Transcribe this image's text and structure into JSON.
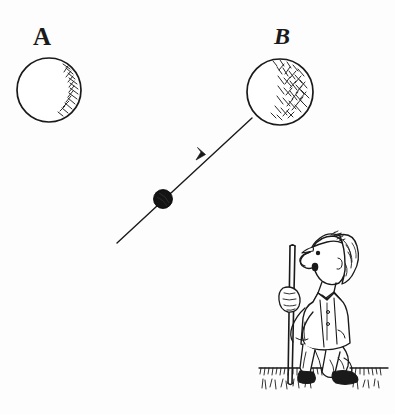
{
  "figure": {
    "background_color": "#fdfdfd",
    "ink_color": "#1a1a1a",
    "width": 395,
    "height": 414,
    "labels": [
      {
        "id": "A",
        "text": "A",
        "x": 33,
        "y": 24
      },
      {
        "id": "B",
        "text": "B",
        "x": 274,
        "y": 24
      }
    ],
    "circles": [
      {
        "name": "circle-a",
        "label": "A",
        "cx": 49,
        "cy": 90,
        "r": 32,
        "shading": "right-edge-hatch",
        "fill": "none"
      },
      {
        "name": "circle-b",
        "label": "B",
        "cx": 280,
        "cy": 92,
        "r": 33,
        "shading": "right-side-hatch",
        "fill": "none"
      }
    ],
    "trajectory": {
      "name": "trajectory-line",
      "start_x": 117,
      "start_y": 243,
      "end_x": 252,
      "end_y": 118,
      "arrow_x": 205,
      "arrow_y": 155,
      "direction": "up-right",
      "stroke_width": 1.3
    },
    "projectile": {
      "name": "projectile-ball",
      "cx": 163,
      "cy": 199,
      "r": 9,
      "fill": "solid-black"
    },
    "ground": {
      "name": "ground-line",
      "y": 369,
      "x_start": 258,
      "x_end": 390,
      "style": "hatched-turf"
    },
    "character": {
      "name": "golfer-figure",
      "description": "cartoon man in cap and vest holding a golf club, looking upward",
      "bounding_box": {
        "x": 258,
        "y": 228,
        "width": 122,
        "height": 160
      },
      "parts": [
        "cap",
        "head",
        "nose",
        "eye",
        "mouth",
        "hair",
        "bow-tie",
        "vest",
        "arm",
        "hand",
        "trousers",
        "shoes",
        "golf-club"
      ]
    }
  }
}
